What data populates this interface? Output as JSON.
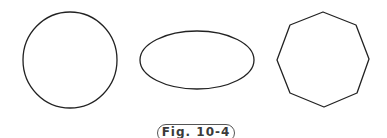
{
  "figure": {
    "caption": "Fig. 10-4",
    "stroke_color": "#222222",
    "shapes": [
      {
        "type": "circle",
        "cx": 70,
        "cy": 60,
        "rx": 47,
        "ry": 48
      },
      {
        "type": "ellipse",
        "cx": 197,
        "cy": 60,
        "rx": 57,
        "ry": 29
      },
      {
        "type": "octagon",
        "points": "323,12 356,25 369,59 357,93 324,107 290,93 277,60 290,25"
      }
    ]
  }
}
